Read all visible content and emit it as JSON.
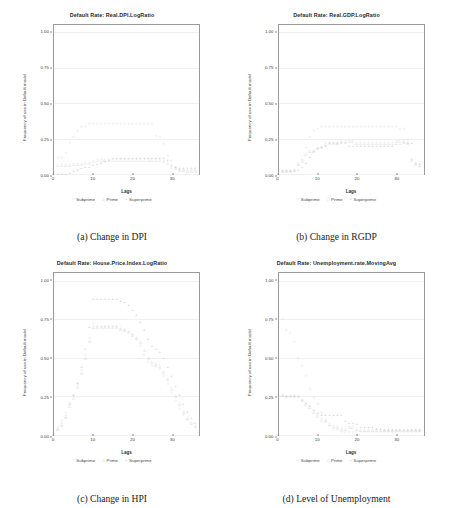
{
  "figure": {
    "panels": [
      {
        "id": "dpi",
        "title": "Default Rate: Real.DPI.LogRatio",
        "caption": "(a) Change in DPI",
        "xlabel": "Lags",
        "ylabel": "Frequency of use in Default model"
      },
      {
        "id": "rgdp",
        "title": "Default Rate: Real.GDP.LogRatio",
        "caption": "(b) Change in RGDP",
        "xlabel": "Lags",
        "ylabel": "Frequency of use in Default model"
      },
      {
        "id": "hpi",
        "title": "Default Rate: House.Price.Index.LogRatio",
        "caption": "(c) Change in HPI",
        "xlabel": "Lags",
        "ylabel": "Frequency of use in Default model"
      },
      {
        "id": "unemp",
        "title": "Default Rate: Unemployment.rate.MovingAvg",
        "caption": "(d) Level of Unemployment",
        "xlabel": "Lags",
        "ylabel": "Frequency of use in Default model"
      }
    ],
    "legend": {
      "items": [
        {
          "label": "Subprime",
          "glyph": "○",
          "color": "#b9b9b9"
        },
        {
          "label": "Prime",
          "glyph": "△",
          "color": "#c9c9c9"
        },
        {
          "label": "Superprime",
          "glyph": "+",
          "color": "#bcbcbc"
        }
      ]
    }
  },
  "chart_data": [
    {
      "type": "scatter",
      "id": "dpi",
      "title": "Default Rate: Real.DPI.LogRatio",
      "xlabel": "Lags",
      "ylabel": "Frequency of use in Default model",
      "xlim": [
        0,
        37
      ],
      "ylim": [
        0,
        1.05
      ],
      "xticks": [
        0,
        10,
        20,
        30
      ],
      "yticks": [
        0.0,
        0.25,
        0.5,
        0.75,
        1.0
      ],
      "ytick_labels": [
        "0.00",
        "0.25",
        "0.50",
        "0.75",
        "1.00"
      ],
      "grid": true,
      "legend_position": "below",
      "x": [
        1,
        2,
        3,
        4,
        5,
        6,
        7,
        8,
        9,
        10,
        11,
        12,
        13,
        14,
        15,
        16,
        17,
        18,
        19,
        20,
        21,
        22,
        23,
        24,
        25,
        26,
        27,
        28,
        29,
        30,
        31,
        32,
        33,
        34,
        35,
        36
      ],
      "series": [
        {
          "name": "Subprime",
          "glyph": "○",
          "color": "#b9b9b9",
          "values": [
            0.11,
            0.11,
            0.15,
            0.22,
            0.26,
            0.3,
            0.33,
            0.33,
            0.35,
            0.35,
            0.35,
            0.35,
            0.35,
            0.35,
            0.35,
            0.35,
            0.35,
            0.35,
            0.35,
            0.35,
            0.35,
            0.35,
            0.35,
            0.35,
            0.35,
            0.27,
            0.26,
            0.21,
            0.13,
            0.09,
            0.04,
            0.03,
            0.02,
            0.02,
            0.02,
            0.02
          ]
        },
        {
          "name": "Prime",
          "glyph": "△",
          "color": "#c9c9c9",
          "values": [
            0.06,
            0.06,
            0.06,
            0.06,
            0.07,
            0.07,
            0.07,
            0.08,
            0.08,
            0.09,
            0.1,
            0.1,
            0.1,
            0.1,
            0.1,
            0.1,
            0.1,
            0.1,
            0.1,
            0.1,
            0.1,
            0.1,
            0.1,
            0.1,
            0.1,
            0.1,
            0.1,
            0.09,
            0.08,
            0.05,
            0.04,
            0.03,
            0.03,
            0.02,
            0.02,
            0.02
          ]
        },
        {
          "name": "Superprime",
          "glyph": "+",
          "color": "#bcbcbc",
          "values": [
            0.0,
            0.0,
            0.0,
            0.01,
            0.02,
            0.03,
            0.04,
            0.05,
            0.05,
            0.06,
            0.07,
            0.08,
            0.09,
            0.1,
            0.11,
            0.11,
            0.11,
            0.11,
            0.11,
            0.11,
            0.11,
            0.11,
            0.11,
            0.11,
            0.11,
            0.11,
            0.11,
            0.11,
            0.1,
            0.06,
            0.05,
            0.04,
            0.04,
            0.04,
            0.04,
            0.04
          ]
        }
      ]
    },
    {
      "type": "scatter",
      "id": "rgdp",
      "title": "Default Rate: Real.GDP.LogRatio",
      "xlabel": "Lags",
      "ylabel": "Frequency of use in Default model",
      "xlim": [
        0,
        37
      ],
      "ylim": [
        0,
        1.05
      ],
      "xticks": [
        0,
        10,
        20,
        30
      ],
      "yticks": [
        0.0,
        0.25,
        0.5,
        0.75,
        1.0
      ],
      "ytick_labels": [
        "0.00",
        "0.25",
        "0.50",
        "0.75",
        "1.00"
      ],
      "grid": true,
      "legend_position": "below",
      "x": [
        1,
        2,
        3,
        4,
        5,
        6,
        7,
        8,
        9,
        10,
        11,
        12,
        13,
        14,
        15,
        16,
        17,
        18,
        19,
        20,
        21,
        22,
        23,
        24,
        25,
        26,
        27,
        28,
        29,
        30,
        31,
        32,
        33,
        34,
        35,
        36
      ],
      "series": [
        {
          "name": "Subprime",
          "glyph": "○",
          "color": "#b9b9b9",
          "values": [
            0.02,
            0.02,
            0.02,
            0.03,
            0.06,
            0.1,
            0.18,
            0.26,
            0.3,
            0.32,
            0.33,
            0.33,
            0.33,
            0.33,
            0.33,
            0.33,
            0.33,
            0.33,
            0.33,
            0.33,
            0.33,
            0.33,
            0.33,
            0.33,
            0.33,
            0.33,
            0.33,
            0.33,
            0.33,
            0.33,
            0.32,
            0.32,
            0.24,
            0.1,
            0.06,
            0.05
          ]
        },
        {
          "name": "Prime",
          "glyph": "△",
          "color": "#c9c9c9",
          "values": [
            0.02,
            0.02,
            0.02,
            0.03,
            0.07,
            0.09,
            0.14,
            0.16,
            0.16,
            0.18,
            0.19,
            0.21,
            0.22,
            0.22,
            0.22,
            0.23,
            0.23,
            0.23,
            0.23,
            0.22,
            0.22,
            0.22,
            0.22,
            0.22,
            0.22,
            0.22,
            0.22,
            0.22,
            0.22,
            0.23,
            0.23,
            0.23,
            0.22,
            0.1,
            0.07,
            0.06
          ]
        },
        {
          "name": "Superprime",
          "glyph": "+",
          "color": "#bcbcbc",
          "values": [
            0.02,
            0.02,
            0.02,
            0.02,
            0.03,
            0.05,
            0.08,
            0.12,
            0.16,
            0.18,
            0.19,
            0.2,
            0.22,
            0.22,
            0.22,
            0.22,
            0.22,
            0.2,
            0.2,
            0.2,
            0.2,
            0.2,
            0.2,
            0.2,
            0.2,
            0.2,
            0.2,
            0.2,
            0.2,
            0.21,
            0.21,
            0.22,
            0.22,
            0.22,
            0.08,
            0.07
          ]
        }
      ]
    },
    {
      "type": "scatter",
      "id": "hpi",
      "title": "Default Rate: House.Price.Index.LogRatio",
      "xlabel": "Lags",
      "ylabel": "Frequency of use in Default model",
      "xlim": [
        0,
        37
      ],
      "ylim": [
        0,
        1.05
      ],
      "xticks": [
        0,
        10,
        20,
        30
      ],
      "yticks": [
        0.0,
        0.25,
        0.5,
        0.75,
        1.0
      ],
      "ytick_labels": [
        "0.00",
        "0.25",
        "0.50",
        "0.75",
        "1.00"
      ],
      "grid": true,
      "legend_position": "below",
      "x": [
        1,
        2,
        3,
        4,
        5,
        6,
        7,
        8,
        9,
        10,
        11,
        12,
        13,
        14,
        15,
        16,
        17,
        18,
        19,
        20,
        21,
        22,
        23,
        24,
        25,
        26,
        27,
        28,
        29,
        30,
        31,
        32,
        33,
        34,
        35,
        36
      ],
      "series": [
        {
          "name": "Subprime",
          "glyph": "○",
          "color": "#b9b9b9",
          "values": [
            0.05,
            0.09,
            0.14,
            0.21,
            0.25,
            0.33,
            0.42,
            0.52,
            0.63,
            0.72,
            0.7,
            0.7,
            0.7,
            0.7,
            0.7,
            0.7,
            0.69,
            0.68,
            0.67,
            0.65,
            0.62,
            0.58,
            0.52,
            0.47,
            0.45,
            0.44,
            0.43,
            0.38,
            0.33,
            0.27,
            0.22,
            0.17,
            0.13,
            0.1,
            0.07,
            0.05
          ]
        },
        {
          "name": "Prime",
          "glyph": "△",
          "color": "#c9c9c9",
          "values": [
            0.04,
            0.07,
            0.12,
            0.19,
            0.24,
            0.31,
            0.4,
            0.5,
            0.61,
            0.7,
            0.7,
            0.7,
            0.7,
            0.7,
            0.7,
            0.7,
            0.69,
            0.68,
            0.67,
            0.65,
            0.63,
            0.6,
            0.55,
            0.5,
            0.47,
            0.46,
            0.45,
            0.41,
            0.36,
            0.3,
            0.25,
            0.2,
            0.15,
            0.11,
            0.08,
            0.06
          ]
        },
        {
          "name": "Superprime",
          "glyph": "+",
          "color": "#bcbcbc",
          "values": [
            0.04,
            0.06,
            0.11,
            0.2,
            0.26,
            0.34,
            0.44,
            0.56,
            0.7,
            0.88,
            0.88,
            0.88,
            0.88,
            0.88,
            0.88,
            0.88,
            0.87,
            0.86,
            0.84,
            0.81,
            0.78,
            0.73,
            0.68,
            0.62,
            0.58,
            0.56,
            0.54,
            0.5,
            0.44,
            0.38,
            0.32,
            0.26,
            0.2,
            0.15,
            0.11,
            0.08
          ]
        }
      ]
    },
    {
      "type": "scatter",
      "id": "unemp",
      "title": "Default Rate: Unemployment.rate.MovingAvg",
      "xlabel": "Lags",
      "ylabel": "Frequency of use in Default model",
      "xlim": [
        0,
        37
      ],
      "ylim": [
        0,
        1.05
      ],
      "xticks": [
        0,
        10,
        20,
        30
      ],
      "yticks": [
        0.0,
        0.25,
        0.5,
        0.75,
        1.0
      ],
      "ytick_labels": [
        "0.00",
        "0.25",
        "0.50",
        "0.75",
        "1.00"
      ],
      "grid": true,
      "legend_position": "below",
      "x": [
        1,
        2,
        3,
        4,
        5,
        6,
        7,
        8,
        9,
        10,
        11,
        12,
        13,
        14,
        15,
        16,
        17,
        18,
        19,
        20,
        21,
        22,
        23,
        24,
        25,
        26,
        27,
        28,
        29,
        30,
        31,
        32,
        33,
        34,
        35,
        36
      ],
      "series": [
        {
          "name": "Subprime",
          "glyph": "○",
          "color": "#b9b9b9",
          "values": [
            0.75,
            0.68,
            0.66,
            0.6,
            0.5,
            0.45,
            0.38,
            0.3,
            0.24,
            0.2,
            0.14,
            0.09,
            0.06,
            0.04,
            0.03,
            0.02,
            0.02,
            0.02,
            0.02,
            0.02,
            0.02,
            0.02,
            0.02,
            0.02,
            0.02,
            0.02,
            0.02,
            0.02,
            0.02,
            0.02,
            0.02,
            0.02,
            0.02,
            0.02,
            0.02,
            0.02
          ]
        },
        {
          "name": "Prime",
          "glyph": "△",
          "color": "#c9c9c9",
          "values": [
            0.26,
            0.25,
            0.25,
            0.25,
            0.25,
            0.23,
            0.2,
            0.18,
            0.15,
            0.12,
            0.1,
            0.09,
            0.07,
            0.06,
            0.05,
            0.04,
            0.04,
            0.05,
            0.05,
            0.04,
            0.03,
            0.03,
            0.03,
            0.03,
            0.03,
            0.03,
            0.03,
            0.03,
            0.03,
            0.03,
            0.03,
            0.03,
            0.03,
            0.03,
            0.03,
            0.03
          ]
        },
        {
          "name": "Superprime",
          "glyph": "+",
          "color": "#bcbcbc",
          "values": [
            0.25,
            0.25,
            0.25,
            0.25,
            0.25,
            0.23,
            0.21,
            0.19,
            0.16,
            0.14,
            0.13,
            0.13,
            0.13,
            0.13,
            0.13,
            0.13,
            0.09,
            0.08,
            0.08,
            0.07,
            0.05,
            0.05,
            0.05,
            0.05,
            0.04,
            0.04,
            0.03,
            0.03,
            0.03,
            0.03,
            0.03,
            0.03,
            0.03,
            0.03,
            0.03,
            0.03
          ]
        }
      ]
    }
  ]
}
